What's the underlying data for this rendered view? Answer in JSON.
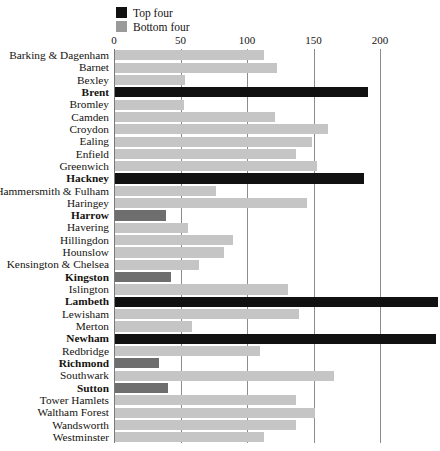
{
  "legend": {
    "items": [
      {
        "label": "Top four",
        "color": "#111111",
        "swatch_name": "legend-swatch-top-four"
      },
      {
        "label": "Bottom four",
        "color": "#9a9a9a",
        "swatch_name": "legend-swatch-bottom-four"
      }
    ]
  },
  "colors": {
    "top_four": "#111111",
    "bottom_four": "#6e6e6e",
    "normal": "#c5c5c5",
    "gridline": "#8c8c8c",
    "text": "#15130f",
    "background": "#ffffff"
  },
  "chart_data": {
    "type": "bar",
    "orientation": "horizontal",
    "title": "",
    "xlabel": "",
    "ylabel": "",
    "xlim": [
      0,
      245
    ],
    "xticks": [
      0,
      50,
      100,
      150,
      200
    ],
    "xtick_labels": [
      "0",
      "50",
      "100",
      "150",
      "200"
    ],
    "grid": true,
    "legend_position": "top-left",
    "categories": [
      "Barking & Dagenham",
      "Barnet",
      "Bexley",
      "Brent",
      "Bromley",
      "Camden",
      "Croydon",
      "Ealing",
      "Enfield",
      "Greenwich",
      "Hackney",
      "Hammersmith & Fulham",
      "Haringey",
      "Harrow",
      "Havering",
      "Hillingdon",
      "Hounslow",
      "Kensington & Chelsea",
      "Kingston",
      "Islington",
      "Lambeth",
      "Lewisham",
      "Merton",
      "Newham",
      "Redbridge",
      "Richmond",
      "Southwark",
      "Sutton",
      "Tower Hamlets",
      "Waltham Forest",
      "Wandsworth",
      "Westminster"
    ],
    "values": [
      112,
      122,
      53,
      190,
      52,
      120,
      160,
      148,
      136,
      152,
      187,
      76,
      144,
      38,
      55,
      89,
      82,
      63,
      42,
      130,
      243,
      138,
      58,
      241,
      109,
      33,
      165,
      40,
      136,
      150,
      136,
      112
    ],
    "group": [
      "normal",
      "normal",
      "normal",
      "top",
      "normal",
      "normal",
      "normal",
      "normal",
      "normal",
      "normal",
      "top",
      "normal",
      "normal",
      "bottom",
      "normal",
      "normal",
      "normal",
      "normal",
      "bottom",
      "normal",
      "top",
      "normal",
      "normal",
      "top",
      "normal",
      "bottom",
      "normal",
      "bottom",
      "normal",
      "normal",
      "normal",
      "normal"
    ],
    "highlighted": [
      "Brent",
      "Hackney",
      "Harrow",
      "Kingston",
      "Lambeth",
      "Newham",
      "Richmond",
      "Sutton"
    ],
    "series": [
      {
        "name": "Top four",
        "members": [
          "Brent",
          "Hackney",
          "Lambeth",
          "Newham"
        ]
      },
      {
        "name": "Bottom four",
        "members": [
          "Harrow",
          "Kingston",
          "Richmond",
          "Sutton"
        ]
      }
    ]
  }
}
